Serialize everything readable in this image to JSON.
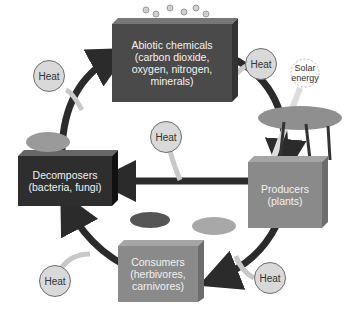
{
  "diagram": {
    "title": "",
    "nodes": {
      "abiotic": {
        "line1": "Abiotic chemicals",
        "line2": "(carbon dioxide,",
        "line3": "oxygen, nitrogen,",
        "line4": "minerals)"
      },
      "producers": {
        "line1": "Producers",
        "line2": "(plants)"
      },
      "consumers": {
        "line1": "Consumers",
        "line2": "(herbivores,",
        "line3": "carnivores)"
      },
      "decomposers": {
        "line1": "Decomposers",
        "line2": "(bacteria, fungi)"
      }
    },
    "heat_labels": [
      "Heat",
      "Heat",
      "Heat",
      "Heat",
      "Heat",
      "Heat"
    ],
    "solar": {
      "line1": "Solar",
      "line2": "energy"
    },
    "colors": {
      "abiotic_box": "#4a4a4a",
      "decomposers_box": "#2e2e2e",
      "producers_box": "#8a8a8a",
      "consumers_box": "#8a8a8a",
      "cycle_arrow": "#2b2b2b",
      "heat_circle": "#d9d9d9",
      "heat_arrow": "#e0e0e0"
    }
  }
}
